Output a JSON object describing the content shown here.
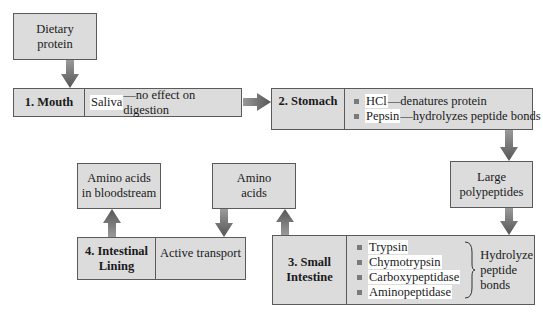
{
  "diagram": {
    "start": {
      "label_line1": "Dietary",
      "label_line2": "protein"
    },
    "mouth": {
      "stage": "1. Mouth",
      "highlight": "Saliva",
      "text": "—no effect on digestion"
    },
    "stomach": {
      "stage": "2. Stomach",
      "items": [
        {
          "highlight": "HCl",
          "text": "—denatures protein"
        },
        {
          "highlight": "Pepsin",
          "text": "—hydrolyzes peptide bonds"
        }
      ]
    },
    "large_polypeptides": {
      "label_line1": "Large",
      "label_line2": "polypeptides"
    },
    "small_intestine": {
      "stage_line1": "3. Small",
      "stage_line2": "Intestine",
      "enzymes": [
        "Trypsin",
        "Chymotrypsin",
        "Carboxypeptidase",
        "Aminopeptidase"
      ],
      "action_line1": "Hydrolyze",
      "action_line2": "peptide",
      "action_line3": "bonds"
    },
    "amino_acids": {
      "label_line1": "Amino",
      "label_line2": "acids"
    },
    "intestinal_lining": {
      "stage_line1": "4. Intestinal",
      "stage_line2": "Lining",
      "process": "Active transport"
    },
    "bloodstream": {
      "label_line1": "Amino acids",
      "label_line2": "in bloodstream"
    },
    "colors": {
      "box_fill": "#dcdcdc",
      "border": "#5a5a5a",
      "arrow": "#6e6e6e",
      "highlight": "#ffffff"
    }
  }
}
